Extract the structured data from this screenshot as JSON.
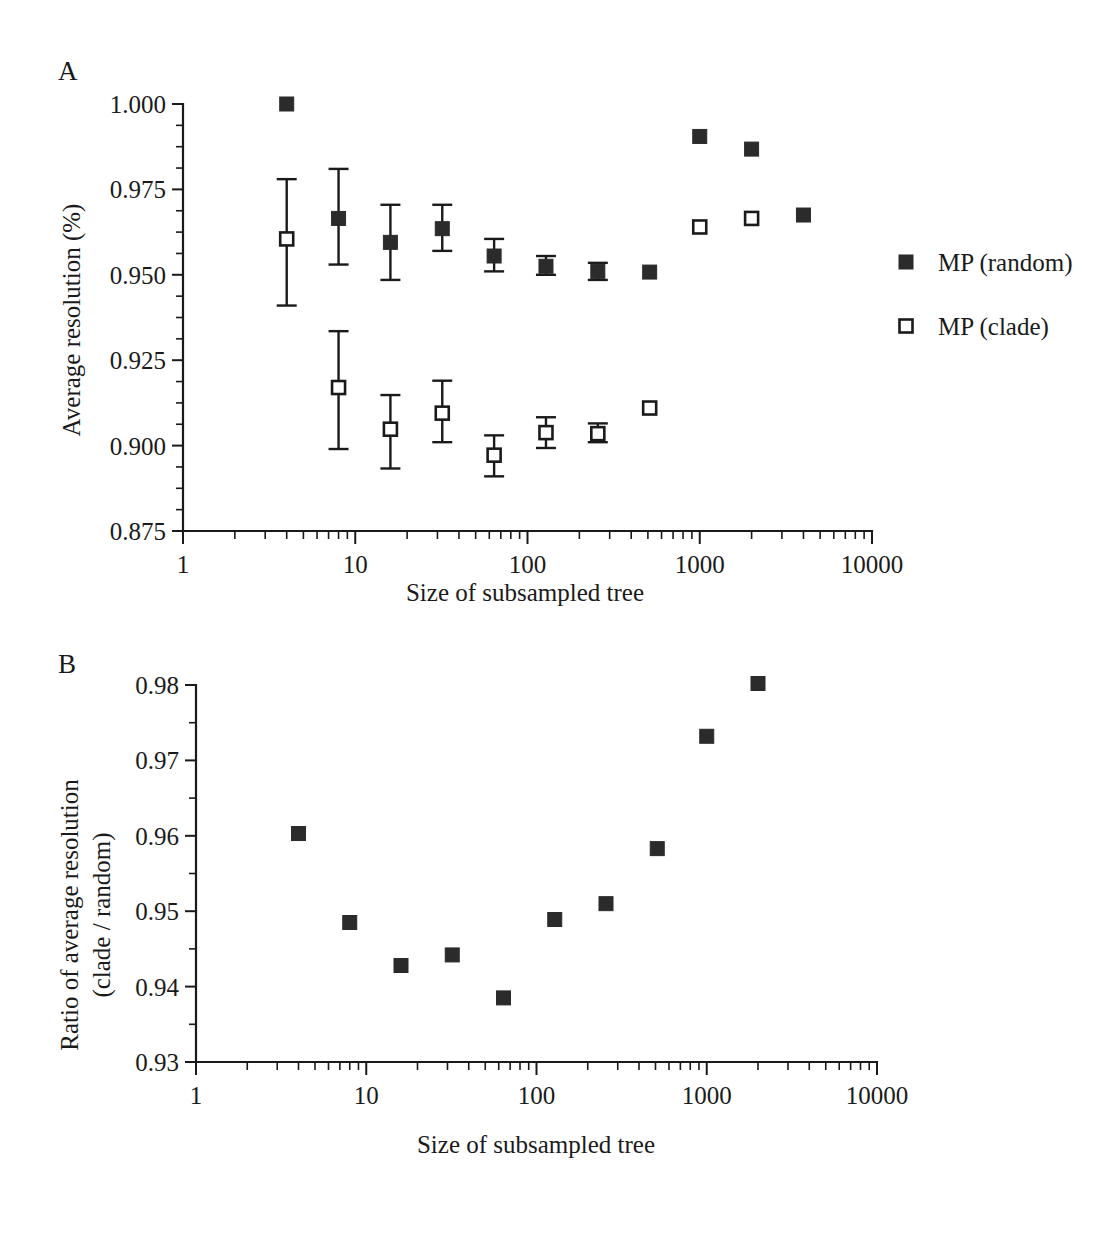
{
  "figure": {
    "background_color": "#ffffff",
    "ink_color": "#1a1a1a",
    "marker_fill_color": "#2b2b2b"
  },
  "panel_a": {
    "letter": "A",
    "legend": {
      "entries": [
        {
          "label": "MP (random)",
          "marker": "filled-square",
          "icon_name": "legend-filled-square-icon"
        },
        {
          "label": "MP (clade)",
          "marker": "open-square",
          "icon_name": "legend-open-square-icon"
        }
      ]
    }
  },
  "panel_b": {
    "letter": "B"
  },
  "chart_data": [
    {
      "id": "panel-a",
      "panel": "A",
      "type": "scatter",
      "title": "",
      "xlabel": "Size of subsampled tree",
      "ylabel": "Average resolution (%)",
      "xscale": "log",
      "xlim": [
        1,
        10000
      ],
      "ylim": [
        0.875,
        1.0
      ],
      "xticks": [
        1,
        10,
        100,
        1000,
        10000
      ],
      "xticklabels": [
        "1",
        "10",
        "100",
        "1000",
        "10000"
      ],
      "yticks": [
        0.875,
        0.9,
        0.925,
        0.95,
        0.975,
        1.0
      ],
      "yticklabels": [
        "0.875",
        "0.900",
        "0.925",
        "0.950",
        "0.975",
        "1.000"
      ],
      "y_minor_per_major": 4,
      "grid": false,
      "legend_position": "right",
      "series": [
        {
          "name": "MP (random)",
          "marker": "filled-square",
          "x": [
            4,
            8,
            16,
            32,
            64,
            128,
            256,
            512,
            1000,
            2000,
            4000
          ],
          "values": [
            1.0,
            0.9665,
            0.9595,
            0.9635,
            0.9555,
            0.9525,
            0.951,
            0.9508,
            0.9905,
            0.9868,
            0.9675
          ],
          "yerr_low": [
            null,
            0.0135,
            0.011,
            0.0065,
            0.0045,
            0.0025,
            0.0025,
            null,
            null,
            null,
            null
          ],
          "yerr_high": [
            null,
            0.0145,
            0.011,
            0.007,
            0.005,
            0.003,
            0.0025,
            null,
            null,
            null,
            null
          ]
        },
        {
          "name": "MP (clade)",
          "marker": "open-square",
          "x": [
            4,
            8,
            16,
            32,
            64,
            128,
            256,
            512,
            1000,
            2000
          ],
          "values": [
            0.9605,
            0.917,
            0.9048,
            0.9095,
            0.8972,
            0.9038,
            0.9035,
            0.911,
            0.964,
            0.9665
          ],
          "yerr_low": [
            0.0195,
            0.018,
            0.0115,
            0.0085,
            0.0062,
            0.0045,
            0.0025,
            null,
            null,
            null
          ],
          "yerr_high": [
            0.0175,
            0.0165,
            0.01,
            0.0095,
            0.0058,
            0.0045,
            0.003,
            null,
            null,
            null
          ]
        }
      ]
    },
    {
      "id": "panel-b",
      "panel": "B",
      "type": "scatter",
      "title": "",
      "xlabel": "Size of subsampled tree",
      "ylabel_line1": "Ratio of average resolution",
      "ylabel_line2": "(clade / random)",
      "xscale": "log",
      "xlim": [
        1,
        10000
      ],
      "ylim": [
        0.93,
        0.98
      ],
      "xticks": [
        1,
        10,
        100,
        1000,
        10000
      ],
      "xticklabels": [
        "1",
        "10",
        "100",
        "1000",
        "10000"
      ],
      "yticks": [
        0.93,
        0.94,
        0.95,
        0.96,
        0.97,
        0.98
      ],
      "yticklabels": [
        "0.93",
        "0.94",
        "0.95",
        "0.96",
        "0.97",
        "0.98"
      ],
      "y_minor_per_major": 2,
      "grid": false,
      "series": [
        {
          "name": "Ratio (clade / random)",
          "marker": "filled-square",
          "x": [
            4,
            8,
            16,
            32,
            64,
            128,
            256,
            512,
            1000,
            2000
          ],
          "values": [
            0.9603,
            0.9485,
            0.9428,
            0.9442,
            0.9385,
            0.9489,
            0.951,
            0.9583,
            0.9732,
            0.9802
          ]
        }
      ]
    }
  ]
}
